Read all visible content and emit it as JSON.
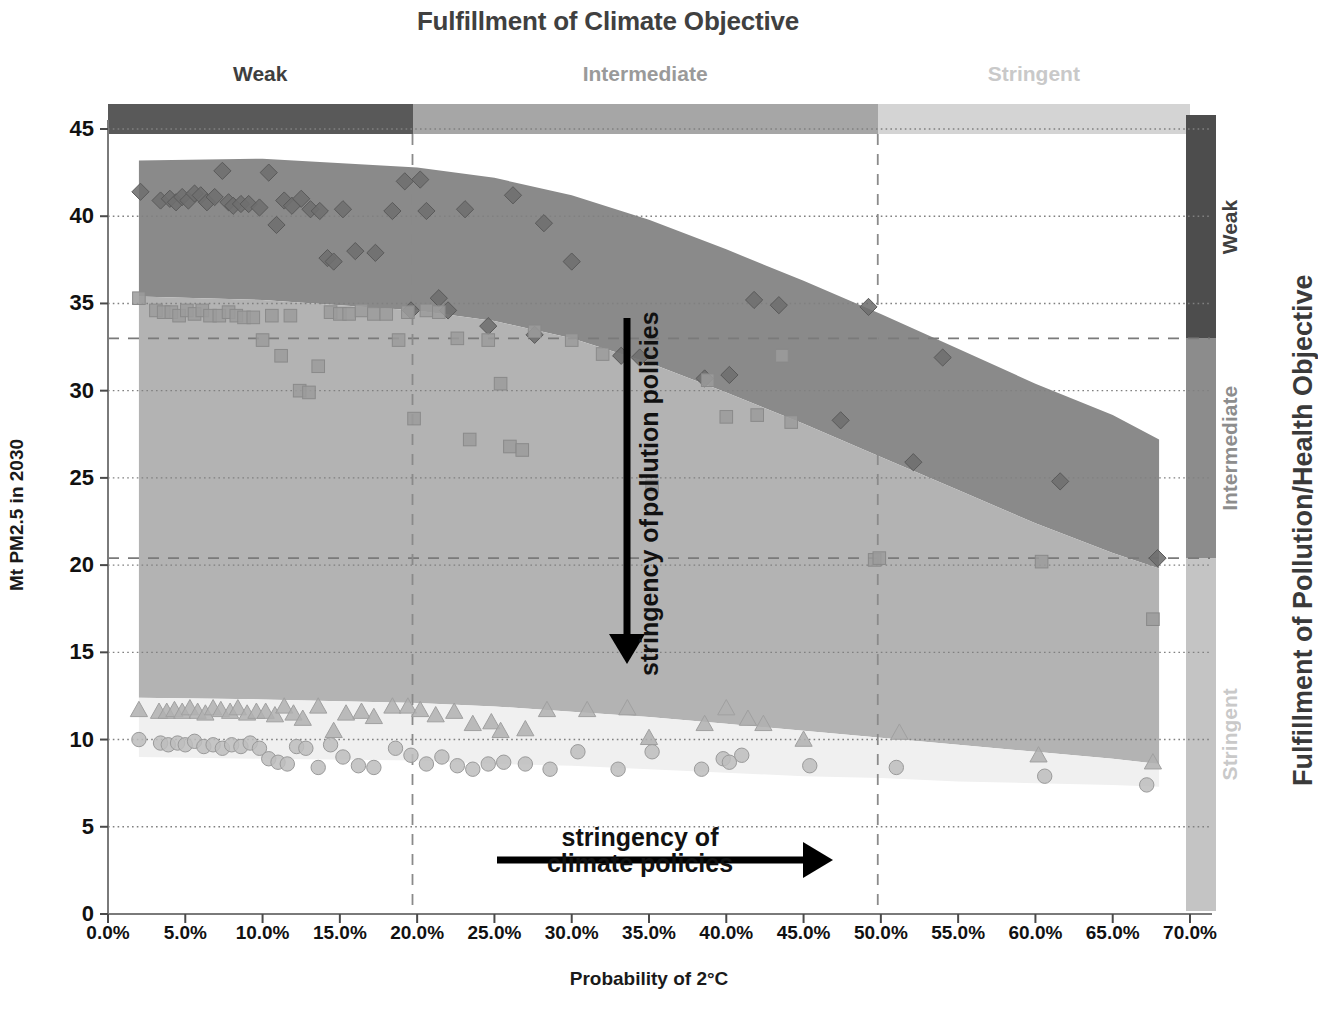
{
  "title": "Fulfillment of Climate Objective",
  "axes": {
    "y_title": "Mt PM2.5 in 2030",
    "x_title": "Probability of 2°C",
    "right_title": "Fulfillment of Pollution/Health Objective",
    "y_ticks": [
      "0",
      "5",
      "10",
      "15",
      "20",
      "25",
      "30",
      "35",
      "40",
      "45"
    ],
    "x_ticks": [
      "0.0%",
      "5.0%",
      "10.0%",
      "15.0%",
      "20.0%",
      "25.0%",
      "30.0%",
      "35.0%",
      "40.0%",
      "45.0%",
      "50.0%",
      "55.0%",
      "60.0%",
      "65.0%",
      "70.0%"
    ]
  },
  "top_bands": [
    {
      "label": "Weak",
      "color": "#595959",
      "from": 0.0,
      "to": 19.7
    },
    {
      "label": "Intermediate",
      "color": "#a6a6a6",
      "from": 19.7,
      "to": 49.8
    },
    {
      "label": "Stringent",
      "color": "#d4d4d4",
      "from": 49.8,
      "to": 70.0
    }
  ],
  "right_bands": [
    {
      "label": "Weak",
      "color": "#4d4d4d",
      "from": 33.0,
      "to": 45.8
    },
    {
      "label": "Intermediate",
      "color": "#8c8c8c",
      "from": 20.4,
      "to": 33.0
    },
    {
      "label": "Stringent",
      "color": "#c4c4c4",
      "from": 0.2,
      "to": 20.4
    }
  ],
  "annotations": {
    "vertical_arrow": "stringency of\npollution policies",
    "vertical_arrow_line1": "stringency of",
    "vertical_arrow_line2": "pollution policies",
    "horizontal_arrow_line1": "stringency of",
    "horizontal_arrow_line2": "climate policies"
  },
  "chart_data": {
    "type": "scatter",
    "title": "Fulfillment of Climate Objective",
    "xlabel": "Probability of 2°C",
    "ylabel": "Mt PM2.5 in 2030",
    "right_axis_label": "Fulfillment of Pollution/Health Objective",
    "xlim": [
      0,
      70
    ],
    "ylim": [
      0,
      45
    ],
    "xticks": [
      0,
      5,
      10,
      15,
      20,
      25,
      30,
      35,
      40,
      45,
      50,
      55,
      60,
      65,
      70
    ],
    "yticks": [
      0,
      5,
      10,
      15,
      20,
      25,
      30,
      35,
      40,
      45
    ],
    "grid": "horizontal-dotted",
    "reference_lines": {
      "horizontal_dashed": [
        33.0,
        20.4
      ],
      "vertical_dashed": [
        19.7,
        49.8
      ]
    },
    "bands": [
      {
        "name": "Weak pollution policy band",
        "color": "#8a8a8a",
        "upper": [
          [
            2,
            43.2
          ],
          [
            10,
            43.3
          ],
          [
            20,
            42.8
          ],
          [
            25,
            42.2
          ],
          [
            30,
            41.2
          ],
          [
            35,
            39.8
          ],
          [
            40,
            38.1
          ],
          [
            45,
            36.3
          ],
          [
            50,
            34.4
          ],
          [
            55,
            32.4
          ],
          [
            60,
            30.4
          ],
          [
            65,
            28.6
          ],
          [
            68,
            27.2
          ]
        ],
        "lower": [
          [
            2,
            35.4
          ],
          [
            10,
            35.2
          ],
          [
            20,
            34.6
          ],
          [
            25,
            34.0
          ],
          [
            30,
            33.0
          ],
          [
            35,
            31.6
          ],
          [
            40,
            29.9
          ],
          [
            45,
            28.1
          ],
          [
            50,
            26.2
          ],
          [
            55,
            24.3
          ],
          [
            60,
            22.4
          ],
          [
            65,
            20.7
          ],
          [
            68,
            19.8
          ]
        ]
      },
      {
        "name": "Intermediate pollution policy band",
        "color": "#b3b3b3",
        "upper": [
          [
            2,
            35.4
          ],
          [
            10,
            35.2
          ],
          [
            20,
            34.6
          ],
          [
            25,
            34.0
          ],
          [
            30,
            33.0
          ],
          [
            35,
            31.6
          ],
          [
            40,
            29.9
          ],
          [
            45,
            28.1
          ],
          [
            50,
            26.2
          ],
          [
            55,
            24.3
          ],
          [
            60,
            22.4
          ],
          [
            65,
            20.7
          ],
          [
            68,
            19.8
          ]
        ],
        "lower": [
          [
            2,
            12.4
          ],
          [
            10,
            12.3
          ],
          [
            20,
            12.1
          ],
          [
            25,
            11.9
          ],
          [
            30,
            11.6
          ],
          [
            35,
            11.3
          ],
          [
            40,
            10.9
          ],
          [
            45,
            10.5
          ],
          [
            50,
            10.1
          ],
          [
            55,
            9.7
          ],
          [
            60,
            9.3
          ],
          [
            65,
            8.9
          ],
          [
            68,
            8.6
          ]
        ]
      },
      {
        "name": "Stringent pollution policy band",
        "color": "#f0f0f0",
        "upper": [
          [
            2,
            12.4
          ],
          [
            10,
            12.3
          ],
          [
            20,
            12.1
          ],
          [
            25,
            11.9
          ],
          [
            30,
            11.6
          ],
          [
            35,
            11.3
          ],
          [
            40,
            10.9
          ],
          [
            45,
            10.5
          ],
          [
            50,
            10.1
          ],
          [
            55,
            9.7
          ],
          [
            60,
            9.3
          ],
          [
            65,
            8.9
          ],
          [
            68,
            8.6
          ]
        ],
        "lower": [
          [
            2,
            9.0
          ],
          [
            10,
            8.9
          ],
          [
            20,
            8.8
          ],
          [
            25,
            8.6
          ],
          [
            30,
            8.5
          ],
          [
            35,
            8.3
          ],
          [
            40,
            8.1
          ],
          [
            45,
            7.9
          ],
          [
            50,
            7.8
          ],
          [
            55,
            7.6
          ],
          [
            60,
            7.5
          ],
          [
            65,
            7.4
          ],
          [
            68,
            7.3
          ]
        ]
      }
    ],
    "series": [
      {
        "name": "Weak pollution policy (diamonds)",
        "marker": "diamond",
        "color": "#6e6e6e",
        "points": [
          [
            2.1,
            41.4
          ],
          [
            3.4,
            40.9
          ],
          [
            4.0,
            41.0
          ],
          [
            4.4,
            40.8
          ],
          [
            4.8,
            41.1
          ],
          [
            5.2,
            40.9
          ],
          [
            5.6,
            41.3
          ],
          [
            6.0,
            41.2
          ],
          [
            6.4,
            40.8
          ],
          [
            6.9,
            41.1
          ],
          [
            7.4,
            42.6
          ],
          [
            7.8,
            40.8
          ],
          [
            8.1,
            40.6
          ],
          [
            8.6,
            40.7
          ],
          [
            9.1,
            40.7
          ],
          [
            9.8,
            40.5
          ],
          [
            10.4,
            42.5
          ],
          [
            10.9,
            39.5
          ],
          [
            11.4,
            40.9
          ],
          [
            11.9,
            40.6
          ],
          [
            12.5,
            41.0
          ],
          [
            13.1,
            40.4
          ],
          [
            13.7,
            40.3
          ],
          [
            14.2,
            37.6
          ],
          [
            14.6,
            37.4
          ],
          [
            15.2,
            40.4
          ],
          [
            16.0,
            38.0
          ],
          [
            17.3,
            37.9
          ],
          [
            18.4,
            40.3
          ],
          [
            19.2,
            42.0
          ],
          [
            19.6,
            34.6
          ],
          [
            20.2,
            42.1
          ],
          [
            20.6,
            40.3
          ],
          [
            21.4,
            35.3
          ],
          [
            22.0,
            34.6
          ],
          [
            23.1,
            40.4
          ],
          [
            24.6,
            33.7
          ],
          [
            26.2,
            41.2
          ],
          [
            27.6,
            33.2
          ],
          [
            28.2,
            39.6
          ],
          [
            30.0,
            37.4
          ],
          [
            33.2,
            32.0
          ],
          [
            34.4,
            31.9
          ],
          [
            38.6,
            30.7
          ],
          [
            40.2,
            30.9
          ],
          [
            41.8,
            35.2
          ],
          [
            43.4,
            34.9
          ],
          [
            47.4,
            28.3
          ],
          [
            49.2,
            34.8
          ],
          [
            52.1,
            25.9
          ],
          [
            54.0,
            31.9
          ],
          [
            61.6,
            24.8
          ],
          [
            67.9,
            20.4
          ]
        ]
      },
      {
        "name": "Intermediate pollution policy (squares)",
        "marker": "square",
        "color": "#9b9b9b",
        "points": [
          [
            2.0,
            35.3
          ],
          [
            3.1,
            34.6
          ],
          [
            3.6,
            34.5
          ],
          [
            4.1,
            34.5
          ],
          [
            4.6,
            34.3
          ],
          [
            5.1,
            34.6
          ],
          [
            5.6,
            34.4
          ],
          [
            6.1,
            34.6
          ],
          [
            6.6,
            34.3
          ],
          [
            7.2,
            34.3
          ],
          [
            7.8,
            34.5
          ],
          [
            8.3,
            34.3
          ],
          [
            8.8,
            34.2
          ],
          [
            9.4,
            34.2
          ],
          [
            10.0,
            32.9
          ],
          [
            10.6,
            34.3
          ],
          [
            11.2,
            32.0
          ],
          [
            11.8,
            34.3
          ],
          [
            12.4,
            30.0
          ],
          [
            13.0,
            29.9
          ],
          [
            13.6,
            31.4
          ],
          [
            14.4,
            34.5
          ],
          [
            15.0,
            34.4
          ],
          [
            15.6,
            34.4
          ],
          [
            16.4,
            34.6
          ],
          [
            17.2,
            34.4
          ],
          [
            18.0,
            34.4
          ],
          [
            18.8,
            32.9
          ],
          [
            19.4,
            34.5
          ],
          [
            19.8,
            28.4
          ],
          [
            20.6,
            34.6
          ],
          [
            21.4,
            34.5
          ],
          [
            22.6,
            33.0
          ],
          [
            23.4,
            27.2
          ],
          [
            24.6,
            32.9
          ],
          [
            25.4,
            30.4
          ],
          [
            26.0,
            26.8
          ],
          [
            26.8,
            26.6
          ],
          [
            27.6,
            33.4
          ],
          [
            30.0,
            32.9
          ],
          [
            32.0,
            32.1
          ],
          [
            35.2,
            24.5
          ],
          [
            38.8,
            30.6
          ],
          [
            40.0,
            28.5
          ],
          [
            42.0,
            28.6
          ],
          [
            43.6,
            32.0
          ],
          [
            44.2,
            28.2
          ],
          [
            49.6,
            20.3
          ],
          [
            49.9,
            20.4
          ],
          [
            60.4,
            20.2
          ],
          [
            67.6,
            16.9
          ]
        ]
      },
      {
        "name": "Stringent pollution policy, upper (triangles)",
        "marker": "triangle",
        "color": "#b0b0b0",
        "points": [
          [
            2.0,
            11.7
          ],
          [
            3.3,
            11.6
          ],
          [
            3.8,
            11.6
          ],
          [
            4.3,
            11.7
          ],
          [
            4.8,
            11.6
          ],
          [
            5.3,
            11.8
          ],
          [
            5.8,
            11.6
          ],
          [
            6.3,
            11.5
          ],
          [
            6.8,
            11.8
          ],
          [
            7.3,
            11.7
          ],
          [
            7.9,
            11.6
          ],
          [
            8.4,
            11.8
          ],
          [
            9.0,
            11.5
          ],
          [
            9.6,
            11.6
          ],
          [
            10.2,
            11.6
          ],
          [
            10.8,
            11.4
          ],
          [
            11.4,
            11.9
          ],
          [
            12.0,
            11.5
          ],
          [
            12.6,
            11.2
          ],
          [
            13.6,
            11.9
          ],
          [
            14.6,
            10.5
          ],
          [
            15.4,
            11.5
          ],
          [
            16.4,
            11.6
          ],
          [
            17.2,
            11.3
          ],
          [
            18.4,
            11.9
          ],
          [
            19.4,
            11.9
          ],
          [
            20.2,
            11.7
          ],
          [
            21.2,
            11.4
          ],
          [
            22.4,
            11.6
          ],
          [
            23.6,
            10.9
          ],
          [
            24.8,
            11.0
          ],
          [
            25.4,
            10.5
          ],
          [
            27.0,
            10.6
          ],
          [
            28.4,
            11.7
          ],
          [
            31.0,
            11.7
          ],
          [
            33.6,
            11.8
          ],
          [
            35.0,
            10.1
          ],
          [
            38.6,
            10.9
          ],
          [
            40.0,
            11.8
          ],
          [
            41.4,
            11.2
          ],
          [
            42.4,
            10.9
          ],
          [
            45.0,
            10.0
          ],
          [
            51.2,
            10.4
          ],
          [
            60.2,
            9.1
          ],
          [
            67.6,
            8.7
          ]
        ]
      },
      {
        "name": "Stringent pollution policy, lower (circles)",
        "marker": "circle",
        "color": "#bdbdbd",
        "points": [
          [
            2.0,
            10.0
          ],
          [
            3.4,
            9.8
          ],
          [
            3.9,
            9.7
          ],
          [
            4.5,
            9.8
          ],
          [
            5.0,
            9.7
          ],
          [
            5.6,
            9.9
          ],
          [
            6.2,
            9.6
          ],
          [
            6.8,
            9.7
          ],
          [
            7.4,
            9.5
          ],
          [
            8.0,
            9.7
          ],
          [
            8.6,
            9.6
          ],
          [
            9.2,
            9.8
          ],
          [
            9.8,
            9.5
          ],
          [
            10.4,
            8.9
          ],
          [
            11.0,
            8.7
          ],
          [
            11.6,
            8.6
          ],
          [
            12.2,
            9.6
          ],
          [
            12.8,
            9.5
          ],
          [
            13.6,
            8.4
          ],
          [
            14.4,
            9.7
          ],
          [
            15.2,
            9.0
          ],
          [
            16.2,
            8.5
          ],
          [
            17.2,
            8.4
          ],
          [
            18.6,
            9.5
          ],
          [
            19.6,
            9.1
          ],
          [
            20.6,
            8.6
          ],
          [
            21.6,
            9.0
          ],
          [
            22.6,
            8.5
          ],
          [
            23.6,
            8.3
          ],
          [
            24.6,
            8.6
          ],
          [
            25.6,
            8.7
          ],
          [
            27.0,
            8.6
          ],
          [
            28.6,
            8.3
          ],
          [
            30.4,
            9.3
          ],
          [
            33.0,
            8.3
          ],
          [
            35.2,
            9.3
          ],
          [
            38.4,
            8.3
          ],
          [
            39.8,
            8.9
          ],
          [
            40.2,
            8.7
          ],
          [
            41.0,
            9.1
          ],
          [
            45.4,
            8.5
          ],
          [
            51.0,
            8.4
          ],
          [
            60.6,
            7.9
          ],
          [
            67.2,
            7.4
          ]
        ]
      }
    ]
  }
}
